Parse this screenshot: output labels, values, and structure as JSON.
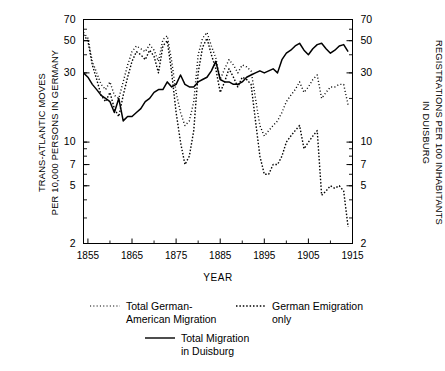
{
  "axes": {
    "y_left_label": "TRANS-ATLANTIC MOVES\nPER 10,000 PERSONS IN GERMANY",
    "y_right_label": "REGISTRATIONS PER 100 INHABITANTS\nIN DUISBURG",
    "x_label": "YEAR",
    "y_ticks": [
      "70",
      "50",
      "30",
      "10",
      "7",
      "5",
      "2"
    ],
    "x_ticks": [
      "1855",
      "1865",
      "1875",
      "1885",
      "1895",
      "1905",
      "1915"
    ]
  },
  "legend": {
    "item1": "Total German-\nAmerican Migration",
    "item2": "German Emigration\nonly",
    "item3": "Total Migration\nin Duisburg"
  },
  "chart_data": {
    "type": "line",
    "title": "",
    "xlabel": "YEAR",
    "ylabel": "TRANS-ATLANTIC MOVES PER 10,000 PERSONS IN GERMANY",
    "ylabel_right": "REGISTRATIONS PER 100 INHABITANTS IN DUISBURG",
    "yscale": "log",
    "ylim": [
      2,
      70
    ],
    "xlim": [
      1854,
      1915
    ],
    "yticks": [
      70,
      50,
      30,
      10,
      7,
      5,
      2
    ],
    "xticks": [
      1855,
      1865,
      1875,
      1885,
      1895,
      1905,
      1915
    ],
    "grid": false,
    "legend_position": "below",
    "series": [
      {
        "name": "Total German-American Migration",
        "style": "dotted",
        "axis": "left",
        "x": [
          1854,
          1855,
          1856,
          1857,
          1858,
          1859,
          1860,
          1861,
          1862,
          1863,
          1864,
          1865,
          1866,
          1867,
          1868,
          1869,
          1870,
          1871,
          1872,
          1873,
          1874,
          1875,
          1876,
          1877,
          1878,
          1879,
          1880,
          1881,
          1882,
          1883,
          1884,
          1885,
          1886,
          1887,
          1888,
          1889,
          1890,
          1891,
          1892,
          1893,
          1894,
          1895,
          1896,
          1897,
          1898,
          1899,
          1900,
          1901,
          1902,
          1903,
          1904,
          1905,
          1906,
          1907,
          1908,
          1909,
          1910,
          1911,
          1912,
          1913,
          1914
        ],
        "y": [
          57,
          52,
          36,
          30,
          25,
          23,
          26,
          21,
          20,
          26,
          34,
          42,
          46,
          44,
          42,
          47,
          43,
          36,
          51,
          54,
          36,
          22,
          16,
          13,
          14,
          19,
          40,
          52,
          57,
          46,
          38,
          27,
          32,
          37,
          34,
          30,
          34,
          33,
          31,
          20,
          13,
          11,
          12,
          13,
          14,
          16,
          19,
          21,
          23,
          26,
          22,
          24,
          27,
          29,
          20,
          22,
          24,
          24,
          25,
          25,
          18
        ]
      },
      {
        "name": "German Emigration only",
        "style": "dotted",
        "axis": "left",
        "x": [
          1854,
          1855,
          1856,
          1857,
          1858,
          1859,
          1860,
          1861,
          1862,
          1863,
          1864,
          1865,
          1866,
          1867,
          1868,
          1869,
          1870,
          1871,
          1872,
          1873,
          1874,
          1875,
          1876,
          1877,
          1878,
          1879,
          1880,
          1881,
          1882,
          1883,
          1884,
          1885,
          1886,
          1887,
          1888,
          1889,
          1890,
          1891,
          1892,
          1893,
          1894,
          1895,
          1896,
          1897,
          1898,
          1899,
          1900,
          1901,
          1902,
          1903,
          1904,
          1905,
          1906,
          1907,
          1908,
          1909,
          1910,
          1911,
          1912,
          1913,
          1914
        ],
        "y": [
          55,
          50,
          34,
          27,
          21,
          19,
          22,
          17,
          15,
          21,
          28,
          36,
          42,
          40,
          37,
          43,
          39,
          30,
          46,
          50,
          30,
          16,
          10,
          7,
          8,
          12,
          30,
          45,
          52,
          40,
          32,
          22,
          26,
          32,
          28,
          24,
          28,
          27,
          25,
          14,
          8,
          6,
          6,
          7,
          7,
          8,
          10,
          11,
          12,
          13,
          9,
          10,
          11,
          12,
          4.3,
          4.6,
          5,
          4.8,
          5,
          4.6,
          2.6
        ]
      },
      {
        "name": "Total Migration in Duisburg",
        "style": "solid",
        "axis": "right",
        "x": [
          1854,
          1855,
          1856,
          1857,
          1858,
          1859,
          1860,
          1861,
          1862,
          1863,
          1864,
          1865,
          1866,
          1867,
          1868,
          1869,
          1870,
          1871,
          1872,
          1873,
          1874,
          1875,
          1876,
          1877,
          1878,
          1879,
          1880,
          1881,
          1882,
          1883,
          1884,
          1885,
          1886,
          1887,
          1888,
          1889,
          1890,
          1891,
          1892,
          1893,
          1894,
          1895,
          1896,
          1897,
          1898,
          1899,
          1900,
          1901,
          1902,
          1903,
          1904,
          1905,
          1906,
          1907,
          1908,
          1909,
          1910,
          1911,
          1912,
          1913,
          1914
        ],
        "y": [
          30,
          28,
          25,
          23,
          21,
          20,
          19,
          16,
          20,
          14,
          15,
          15,
          16,
          17,
          19,
          20,
          22,
          23,
          23,
          26,
          24,
          25,
          29,
          25,
          24,
          24,
          26,
          27,
          28,
          31,
          36,
          27,
          26,
          26,
          25,
          25,
          26,
          28,
          29,
          30,
          31,
          30,
          31,
          32,
          30,
          37,
          41,
          43,
          46,
          48,
          43,
          40,
          44,
          47,
          48,
          44,
          41,
          43,
          46,
          47,
          42
        ]
      }
    ]
  }
}
